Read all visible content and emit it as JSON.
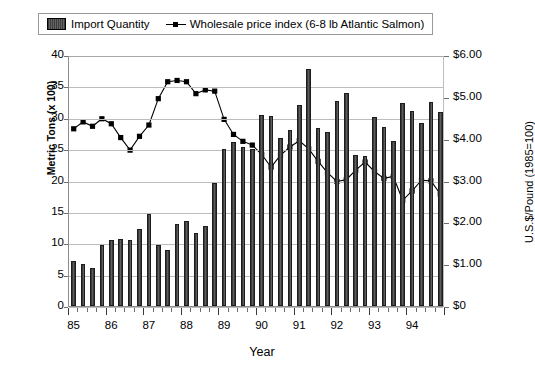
{
  "legend": {
    "bar_label": "Import Quantity",
    "line_label": "Wholesale price index (6-8 lb Atlantic Salmon)"
  },
  "axes": {
    "x_title": "Year",
    "y_left_title": "Metric Tons  (x 100)",
    "y_right_title": "U.S.$/Pound (1985=100)",
    "y_left_ticks": [
      "0",
      "5",
      "10",
      "15",
      "20",
      "25",
      "30",
      "35",
      "40"
    ],
    "y_right_ticks": [
      "$0",
      "$1.00",
      "$2.00",
      "$3.00",
      "$4.00",
      "$5.00",
      "$6.00"
    ],
    "x_ticks": [
      "85",
      "86",
      "87",
      "88",
      "89",
      "90",
      "91",
      "92",
      "93",
      "94"
    ]
  },
  "colors": {
    "bar_fill": "#4a4a4a",
    "bar_edge": "#1d1d1d",
    "line": "#000000",
    "marker": "#000000",
    "grid": "#bcbcbc",
    "frame": "#8c8c8c",
    "background": "#ffffff"
  },
  "chart_data": {
    "type": "bar",
    "title": "",
    "xlabel": "Year",
    "ylabel": "Metric Tons (x 100)",
    "ylabel_secondary": "U.S.$/Pound (1985=100)",
    "ylim": [
      0,
      40
    ],
    "ylim_secondary": [
      0,
      6
    ],
    "grid": true,
    "legend_position": "top",
    "categories": [
      "85Q1",
      "85Q2",
      "85Q3",
      "85Q4",
      "86Q1",
      "86Q2",
      "86Q3",
      "86Q4",
      "87Q1",
      "87Q2",
      "87Q3",
      "87Q4",
      "88Q1",
      "88Q2",
      "88Q3",
      "88Q4",
      "89Q1",
      "89Q2",
      "89Q3",
      "89Q4",
      "90Q1",
      "90Q2",
      "90Q3",
      "90Q4",
      "91Q1",
      "91Q2",
      "91Q3",
      "91Q4",
      "92Q1",
      "92Q2",
      "92Q3",
      "92Q4",
      "93Q1",
      "93Q2",
      "93Q3",
      "93Q4",
      "94Q1",
      "94Q2",
      "94Q3",
      "94Q4"
    ],
    "series": [
      {
        "name": "Import Quantity",
        "kind": "bar",
        "axis": "left",
        "unit": "Metric Tons (x 100)",
        "values": [
          7.2,
          6.7,
          6.0,
          9.8,
          10.6,
          10.7,
          10.6,
          12.2,
          14.6,
          9.8,
          9.0,
          13.1,
          13.5,
          11.7,
          12.8,
          19.6,
          25.1,
          26.2,
          25.3,
          25.0,
          30.5,
          30.3,
          26.8,
          28.0,
          32.0,
          37.7,
          28.3,
          27.8,
          32.6,
          33.9,
          24.0,
          23.9,
          30.2,
          28.5,
          26.3,
          32.4,
          31.0,
          29.2,
          32.5,
          30.9
        ]
      },
      {
        "name": "Wholesale price index (6-8 lb Atlantic Salmon)",
        "kind": "line",
        "axis": "right",
        "unit": "U.S.$/Pound",
        "values_left_scale": [
          28.4,
          29.5,
          28.8,
          30.0,
          29.2,
          27.0,
          25.0,
          27.2,
          29.0,
          33.2,
          35.9,
          36.1,
          35.9,
          34.0,
          34.6,
          34.4,
          29.9,
          27.5,
          26.4,
          25.8,
          24.3,
          22.3,
          24.2,
          25.5,
          26.5,
          25.2,
          23.2,
          21.4,
          20.0,
          20.3,
          21.8,
          23.1,
          21.6,
          20.5,
          20.8,
          17.0,
          18.5,
          20.2,
          20.1,
          18.0
        ],
        "values": [
          4.26,
          4.43,
          4.32,
          4.5,
          4.38,
          4.05,
          3.75,
          4.08,
          4.35,
          4.98,
          5.39,
          5.42,
          5.39,
          5.1,
          5.19,
          5.16,
          4.49,
          4.13,
          3.96,
          3.87,
          3.65,
          3.35,
          3.63,
          3.83,
          3.98,
          3.78,
          3.48,
          3.21,
          3.0,
          3.05,
          3.27,
          3.47,
          3.24,
          3.08,
          3.12,
          2.55,
          2.78,
          3.03,
          3.02,
          2.7
        ]
      }
    ]
  }
}
